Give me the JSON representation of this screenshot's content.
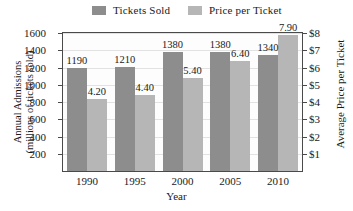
{
  "chart_data": {
    "type": "bar",
    "title": "",
    "categories": [
      "1990",
      "1995",
      "2000",
      "2005",
      "2010"
    ],
    "series": [
      {
        "name": "Tickets Sold",
        "axis": "left",
        "color": "#8d8d8d",
        "values": [
          1190,
          1210,
          1380,
          1380,
          1340
        ],
        "labels": [
          "1190",
          "1210",
          "1380",
          "1380",
          "1340"
        ]
      },
      {
        "name": "Price per Ticket",
        "axis": "right",
        "color": "#b6b6b6",
        "values": [
          4.2,
          4.4,
          5.4,
          6.4,
          7.9
        ],
        "labels": [
          "4.20",
          "4.40",
          "5.40",
          "6.40",
          "7.90"
        ]
      }
    ],
    "xlabel": "Year",
    "ylabel": "Annual Admissions (millions of tickets sold)",
    "ylabel_line1": "Annual Admissions",
    "ylabel_line2": "(millions of tickets sold)",
    "y2label": "Average Price per Ticket",
    "ylim": [
      0,
      1600
    ],
    "y2lim": [
      0,
      8
    ],
    "yticks": [
      200,
      400,
      600,
      800,
      1000,
      1200,
      1400,
      1600
    ],
    "ytick_labels": [
      "200",
      "400",
      "600",
      "800",
      "1000",
      "1200",
      "1400",
      "1600"
    ],
    "y2ticks": [
      1,
      2,
      3,
      4,
      5,
      6,
      7,
      8
    ],
    "y2tick_labels": [
      "$1",
      "$2",
      "$3",
      "$4",
      "$5",
      "$6",
      "$7",
      "$8"
    ],
    "grid": true,
    "legend_position": "top"
  }
}
